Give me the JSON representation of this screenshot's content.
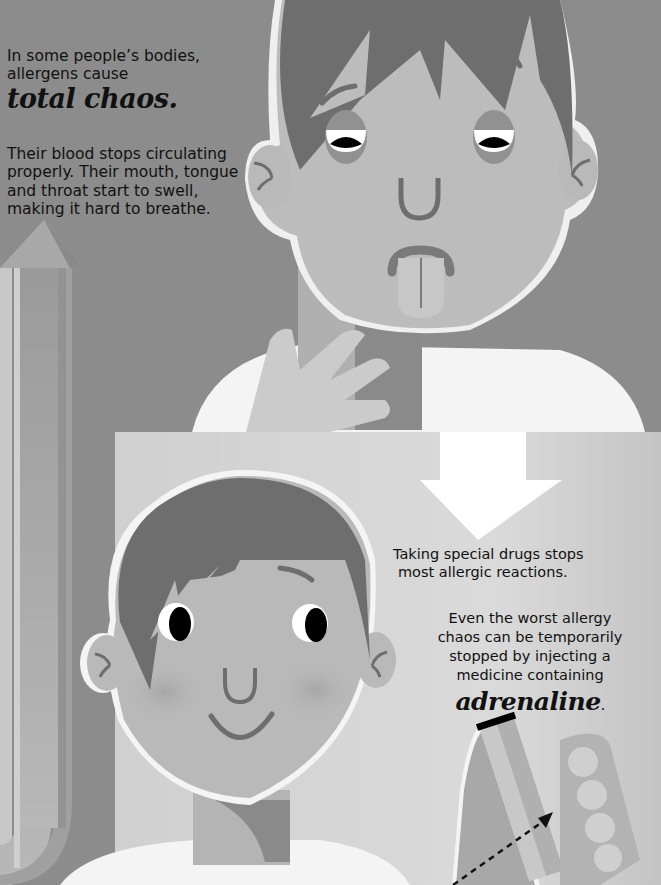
{
  "page": {
    "top_panel": {
      "intro_line1": "In some people’s bodies,",
      "intro_line2": "allergens cause",
      "intro_emphasis": "total chaos.",
      "body_lines": [
        "Their blood stops circulating",
        "properly. Their mouth, tongue",
        "and throat start to swell,",
        "making it hard to breathe."
      ]
    },
    "bottom_panel": {
      "para1_lines": [
        "Taking special drugs stops",
        "most allergic reactions."
      ],
      "para2_lines": [
        "Even the worst allergy",
        "chaos can be temporarily",
        "stopped by injecting a",
        "medicine containing"
      ],
      "para2_emphasis": "adrenaline",
      "para2_end": "."
    },
    "illustrations": {
      "top": "swollen-face-boy-icon",
      "bottom": "recovered-smiling-boy-icon",
      "left_arrow": "up-arrow-icon",
      "center_arrow": "down-arrow-icon",
      "injector": "adrenaline-auto-injector-icon"
    },
    "colors": {
      "background": "#8c8c8c",
      "panel_light": "#d4d4d4",
      "skin": "#b9b9b9",
      "hair": "#6e6e6e",
      "shirt": "#f4f4f4",
      "text": "#111111"
    }
  }
}
